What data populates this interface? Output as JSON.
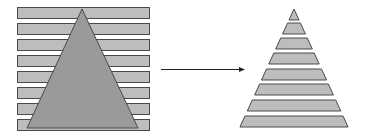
{
  "diagram": {
    "colors": {
      "stripe_fill": "#bdbdbd",
      "triangle_fill": "#9a9a9a",
      "outline": "#4a4a4a",
      "arrow": "#222222",
      "background": "#ffffff"
    },
    "left_panel": {
      "stripe_count": 8,
      "stripe_x": 17,
      "stripe_width": 132,
      "stripe_height": 11,
      "stripe_tops": [
        7,
        23,
        39,
        55,
        71,
        87,
        103,
        119
      ],
      "triangle": {
        "apex": [
          82,
          9
        ],
        "base_left": [
          27,
          128
        ],
        "base_right": [
          138,
          128
        ]
      }
    },
    "arrow": {
      "from": [
        161,
        69
      ],
      "to": [
        245,
        69
      ]
    },
    "right_panel": {
      "slice_count": 8,
      "apex": [
        294,
        9
      ],
      "base_y": 129,
      "base_half_width": 55,
      "slice_height": 11,
      "slice_tops": [
        9,
        23,
        38,
        53,
        69,
        84,
        100,
        116
      ]
    }
  }
}
